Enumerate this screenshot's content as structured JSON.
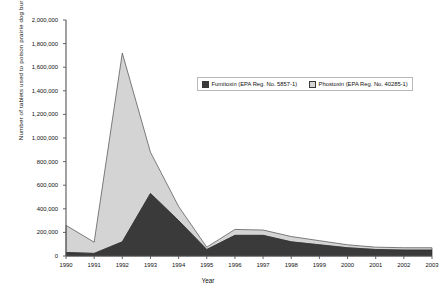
{
  "chart_data": {
    "type": "area",
    "stacked": true,
    "title": "",
    "xlabel": "Year",
    "ylabel": "Number of tablets used to poison prairie dog burrows",
    "categories": [
      "1990",
      "1991",
      "1992",
      "1993",
      "1994",
      "1995",
      "1996",
      "1997",
      "1998",
      "1999",
      "2000",
      "2001",
      "2002",
      "2003"
    ],
    "x": [
      1990,
      1991,
      1992,
      1993,
      1994,
      1995,
      1996,
      1997,
      1998,
      1999,
      2000,
      2001,
      2002,
      2003
    ],
    "ylim": [
      0,
      2000000
    ],
    "xlim": [
      1990,
      2003
    ],
    "ytick_labels": [
      "0",
      "200,000",
      "400,000",
      "600,000",
      "800,000",
      "1,000,000",
      "1,200,000",
      "1,400,000",
      "1,600,000",
      "1,800,000",
      "2,000,000"
    ],
    "ytick_values": [
      0,
      200000,
      400000,
      600000,
      800000,
      1000000,
      1200000,
      1400000,
      1600000,
      1800000,
      2000000
    ],
    "grid": false,
    "legend_position": "upper-center",
    "series": [
      {
        "name": "Fumitoxin (EPA Reg. No. 5857-1)",
        "color": "#3a3a3a",
        "values": [
          30000,
          22000,
          120000,
          530000,
          300000,
          55000,
          175000,
          175000,
          120000,
          95000,
          70000,
          55000,
          50000,
          50000
        ]
      },
      {
        "name": "Phostoxin (EPA Reg. No. 40285-1)",
        "color": "#d4d4d4",
        "values": [
          230000,
          95000,
          1600000,
          350000,
          120000,
          20000,
          50000,
          45000,
          45000,
          35000,
          25000,
          20000,
          20000,
          20000
        ]
      }
    ],
    "totals": [
      260000,
      117000,
      1720000,
      880000,
      420000,
      75000,
      225000,
      220000,
      165000,
      130000,
      95000,
      75000,
      70000,
      70000
    ]
  },
  "legend": {
    "items": [
      {
        "label": "Fumitoxin (EPA Reg. No. 5857-1)",
        "swatch": "dark"
      },
      {
        "label": "Phostoxin (EPA Reg. No. 40285-1)",
        "swatch": "light"
      }
    ]
  },
  "axes": {
    "x_title": "Year",
    "y_title": "Number of tablets used to poison prairie dog burrows"
  }
}
